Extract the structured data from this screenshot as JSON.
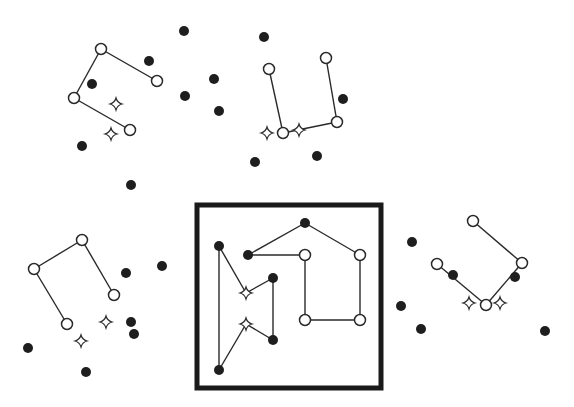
{
  "diagram": {
    "colors": {
      "background": "#ffffff",
      "line": "#2a2a2a",
      "filled_node": "#1e1e1e",
      "frame": "#1a1a1a"
    },
    "frame": {
      "x": 197,
      "y": 205,
      "width": 184,
      "height": 183
    },
    "open_nodes": [
      [
        101,
        49
      ],
      [
        157,
        81
      ],
      [
        74,
        98
      ],
      [
        130,
        130
      ],
      [
        269,
        69
      ],
      [
        326,
        58
      ],
      [
        283,
        133
      ],
      [
        337,
        122
      ],
      [
        305,
        255
      ],
      [
        360,
        255
      ],
      [
        305,
        320
      ],
      [
        360,
        320
      ],
      [
        82,
        240
      ],
      [
        34,
        269
      ],
      [
        114,
        295
      ],
      [
        67,
        324
      ],
      [
        473,
        221
      ],
      [
        522,
        263
      ],
      [
        437,
        264
      ],
      [
        486,
        305
      ]
    ],
    "filled_nodes": [
      [
        92,
        84
      ],
      [
        149,
        61
      ],
      [
        82,
        146
      ],
      [
        184,
        31
      ],
      [
        264,
        37
      ],
      [
        214,
        79
      ],
      [
        185,
        96
      ],
      [
        219,
        111
      ],
      [
        255,
        162
      ],
      [
        131,
        185
      ],
      [
        343,
        99
      ],
      [
        317,
        156
      ],
      [
        219,
        246
      ],
      [
        248,
        255
      ],
      [
        305,
        223
      ],
      [
        273,
        278
      ],
      [
        273,
        340
      ],
      [
        219,
        370
      ],
      [
        126,
        273
      ],
      [
        162,
        266
      ],
      [
        131,
        322
      ],
      [
        134,
        334
      ],
      [
        28,
        348
      ],
      [
        86,
        372
      ],
      [
        453,
        275
      ],
      [
        515,
        277
      ],
      [
        412,
        242
      ],
      [
        401,
        306
      ],
      [
        421,
        329
      ],
      [
        545,
        331
      ]
    ],
    "star_nodes": [
      [
        116,
        104
      ],
      [
        111,
        134
      ],
      [
        267,
        133
      ],
      [
        299,
        130
      ],
      [
        246,
        293
      ],
      [
        246,
        324
      ],
      [
        106,
        322
      ],
      [
        81,
        341
      ],
      [
        469,
        303
      ],
      [
        500,
        303
      ]
    ],
    "edges": [
      [
        101,
        49,
        157,
        81
      ],
      [
        101,
        49,
        74,
        98
      ],
      [
        74,
        98,
        130,
        130
      ],
      [
        269,
        69,
        283,
        133
      ],
      [
        283,
        133,
        337,
        122
      ],
      [
        337,
        122,
        326,
        58
      ],
      [
        219,
        246,
        246,
        293
      ],
      [
        246,
        293,
        273,
        278
      ],
      [
        273,
        278,
        273,
        340
      ],
      [
        273,
        340,
        246,
        324
      ],
      [
        246,
        324,
        219,
        370
      ],
      [
        219,
        370,
        219,
        246
      ],
      [
        248,
        255,
        305,
        255
      ],
      [
        248,
        255,
        305,
        223
      ],
      [
        305,
        223,
        360,
        255
      ],
      [
        360,
        255,
        360,
        320
      ],
      [
        360,
        320,
        305,
        320
      ],
      [
        305,
        320,
        305,
        255
      ],
      [
        82,
        240,
        34,
        269
      ],
      [
        34,
        269,
        67,
        324
      ],
      [
        82,
        240,
        114,
        295
      ],
      [
        473,
        221,
        522,
        263
      ],
      [
        522,
        263,
        486,
        305
      ],
      [
        486,
        305,
        437,
        264
      ]
    ]
  }
}
